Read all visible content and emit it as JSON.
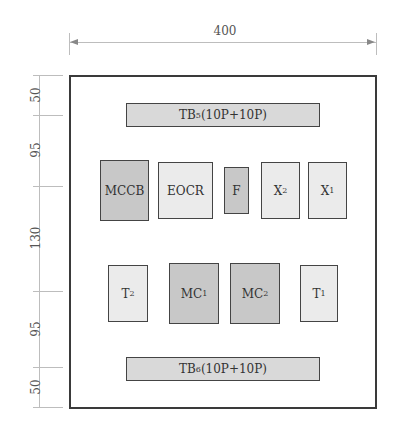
{
  "dimensions": {
    "width_label": "400",
    "vertical": [
      {
        "label": "50",
        "from_y": 75,
        "to_y": 115
      },
      {
        "label": "95",
        "from_y": 115,
        "to_y": 186
      },
      {
        "label": "130",
        "from_y": 186,
        "to_y": 291
      },
      {
        "label": "95",
        "from_y": 291,
        "to_y": 367
      },
      {
        "label": "50",
        "from_y": 367,
        "to_y": 407
      }
    ]
  },
  "terminal_blocks": {
    "top": {
      "base": "TB",
      "sub": "5",
      "suffix": "(10P+10P)"
    },
    "bottom": {
      "base": "TB",
      "sub": "6",
      "suffix": "(10P+10P)"
    }
  },
  "row1": [
    {
      "base": "MCCB",
      "sub": ""
    },
    {
      "base": "EOCR",
      "sub": ""
    },
    {
      "base": "F",
      "sub": ""
    },
    {
      "base": "X",
      "sub": "2"
    },
    {
      "base": "X",
      "sub": "1"
    }
  ],
  "row2": [
    {
      "base": "T",
      "sub": "2"
    },
    {
      "base": "MC",
      "sub": "1"
    },
    {
      "base": "MC",
      "sub": "2"
    },
    {
      "base": "T",
      "sub": "1"
    }
  ],
  "colors": {
    "dark_fill": "#c8c8c8",
    "light_fill": "#ebebeb",
    "terminal_fill": "#d9d9d9",
    "border": "#3a3a3a"
  }
}
